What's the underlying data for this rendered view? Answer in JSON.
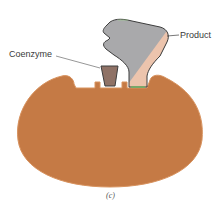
{
  "figure": {
    "caption": "(c)",
    "labels": {
      "coenzyme": "Coenzyme",
      "product": "Product"
    },
    "colors": {
      "enzyme": "#c57a45",
      "enzyme_edge": "#d8935f",
      "coenzyme": "#8f7266",
      "product_grey": "#a9a9ab",
      "product_pink": "#ecc4ad",
      "outline": "#3d3d3d",
      "bond_highlight": "#5fcf5f",
      "leader_line": "#6a6a6a"
    },
    "parts": [
      "enzyme",
      "coenzyme",
      "product"
    ]
  }
}
